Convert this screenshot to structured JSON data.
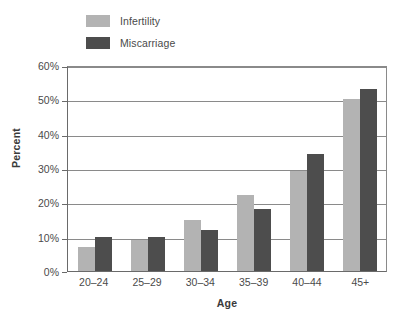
{
  "chart_data": {
    "type": "bar",
    "title": "",
    "xlabel": "Age",
    "ylabel": "Percent",
    "categories": [
      "20–24",
      "25–29",
      "30–34",
      "35–39",
      "40–44",
      "45+"
    ],
    "series": [
      {
        "name": "Infertility",
        "color": "#b3b3b3",
        "values": [
          7,
          9,
          15,
          22,
          29,
          50
        ]
      },
      {
        "name": "Miscarriage",
        "color": "#4d4d4d",
        "values": [
          10,
          10,
          12,
          18,
          34,
          53
        ]
      }
    ],
    "ylim": [
      0,
      60
    ],
    "ytick_values": [
      0,
      10,
      20,
      30,
      40,
      50,
      60
    ],
    "ytick_labels": [
      "0%",
      "10%",
      "20%",
      "30%",
      "40%",
      "50%",
      "60%"
    ],
    "grid": true,
    "legend_position": "top-left",
    "value_suffix": "%"
  }
}
